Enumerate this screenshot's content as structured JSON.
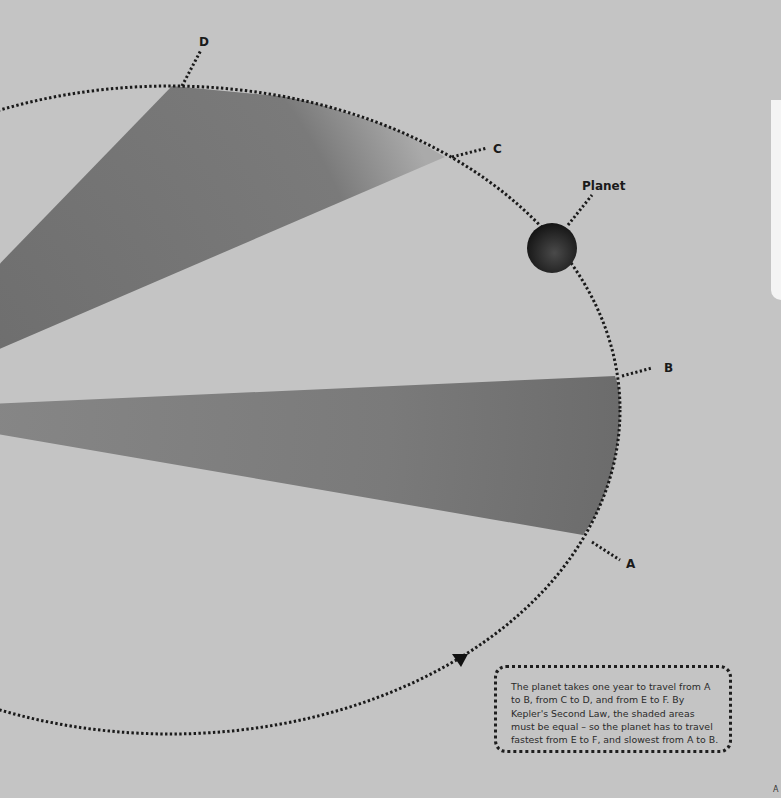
{
  "diagram": {
    "colors": {
      "background": "#c4c4c4",
      "sector": "#6e6e6e",
      "orbit_dots": "#1a1a1a",
      "planet": "#2a2a2a",
      "page_edge": "#f4f4f4"
    },
    "orbit": {
      "cx": 170,
      "cy": 410,
      "rx": 450,
      "ry": 324,
      "direction_marker": "triangle-down-icon"
    },
    "points": [
      {
        "id": "A",
        "label": "A"
      },
      {
        "id": "B",
        "label": "B"
      },
      {
        "id": "C",
        "label": "C"
      },
      {
        "id": "D",
        "label": "D"
      }
    ],
    "planet_label": "Planet",
    "caption": "The planet takes one year to travel from A to B, from C to D, and from E to F. By Kepler's Second Law, the shaded areas must be equal – so the planet has to travel fastest from E to F, and slowest from A to B.",
    "corner_mark": "A"
  }
}
